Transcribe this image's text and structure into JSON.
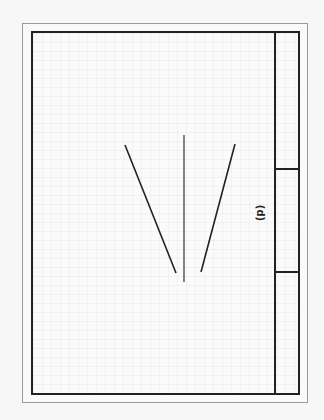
{
  "figure": {
    "panel_label": "(d)",
    "line_color": "#222222",
    "lines": [
      {
        "name": "left-diagonal",
        "x1": 125,
        "y1": 145,
        "x2": 176,
        "y2": 273
      },
      {
        "name": "center-vertical",
        "x1": 184,
        "y1": 135,
        "x2": 184,
        "y2": 282
      },
      {
        "name": "right-diagonal",
        "x1": 235,
        "y1": 144,
        "x2": 201,
        "y2": 272
      }
    ],
    "title_strip_dividers_y": [
      169,
      272
    ]
  }
}
